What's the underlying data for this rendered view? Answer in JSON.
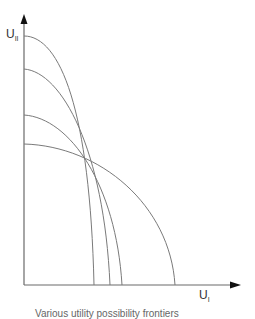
{
  "diagram": {
    "type": "utility-possibility-frontiers",
    "axes": {
      "y": {
        "label": "U",
        "subscript": "II"
      },
      "x": {
        "label": "U",
        "subscript": "I"
      }
    },
    "caption": "Various utility possibility frontiers",
    "colors": {
      "line": "#7a7a7a",
      "axis": "#6a6a6a",
      "arrow": "#111111"
    },
    "curves": [
      {
        "name": "frontier-1",
        "y_intercept_px": 36,
        "x_intercept_px": 94
      },
      {
        "name": "frontier-2",
        "y_intercept_px": 69,
        "x_intercept_px": 110
      },
      {
        "name": "frontier-3",
        "y_intercept_px": 115,
        "x_intercept_px": 122
      },
      {
        "name": "frontier-4",
        "y_intercept_px": 144,
        "x_intercept_px": 175
      }
    ]
  }
}
